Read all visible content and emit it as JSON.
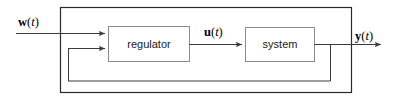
{
  "diagram": {
    "type": "control-system-block-diagram",
    "colors": {
      "line": "#3a3a3a",
      "outer_border": "#2b2b2b",
      "block_border": "#8a8a8a",
      "block_fill": "#ffffff",
      "text": "#1a1a1a",
      "background": "#ffffff"
    },
    "blocks": [
      {
        "id": "regulator",
        "label": "regulator",
        "x": 108,
        "y": 26,
        "width": 82,
        "height": 36
      },
      {
        "id": "system",
        "label": "system",
        "x": 245,
        "y": 27,
        "width": 70,
        "height": 35
      }
    ],
    "outer_boundary": {
      "label": "",
      "x": 60,
      "y": 7,
      "width": 292,
      "height": 86
    },
    "signals": [
      {
        "id": "w",
        "bold_part": "w",
        "var_part": "t",
        "open_paren": "(",
        "close_paren": ")",
        "full_text": "w(t)",
        "role": "reference input",
        "label_x": 18,
        "label_y": 26
      },
      {
        "id": "u",
        "bold_part": "u",
        "var_part": "t",
        "open_paren": "(",
        "close_paren": ")",
        "full_text": "u(t)",
        "role": "control signal",
        "label_x": 204,
        "label_y": 36
      },
      {
        "id": "y",
        "bold_part": "y",
        "var_part": "t",
        "open_paren": "(",
        "close_paren": ")",
        "full_text": "y(t)",
        "role": "output signal",
        "label_x": 355,
        "label_y": 40
      }
    ],
    "connections": [
      {
        "id": "w-to-regulator",
        "from": "external-left",
        "to": "regulator-input-top",
        "arrow": true
      },
      {
        "id": "regulator-to-system",
        "from": "regulator-output",
        "to": "system-input",
        "arrow": true
      },
      {
        "id": "system-to-output",
        "from": "system-output",
        "to": "external-right",
        "arrow": true
      },
      {
        "id": "feedback-loop",
        "from": "output-tap",
        "to": "regulator-input-bottom",
        "arrow": true
      }
    ]
  }
}
